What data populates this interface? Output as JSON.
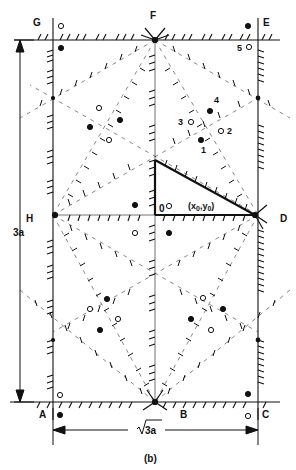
{
  "figure": {
    "caption": "(b)",
    "dimension_vertical": "3a",
    "dimension_horizontal": "√3a",
    "dimension_horizontal_radicand": "3a"
  },
  "vertices": {
    "G": "G",
    "F": "F",
    "E": "E",
    "H": "H",
    "D": "D",
    "A": "A",
    "B": "B",
    "C": "C",
    "O": "0"
  },
  "numbered_points": [
    "1",
    "2",
    "3",
    "4",
    "5"
  ],
  "point_label": "(x₀,y₀)",
  "point_label_parts": {
    "open": "(x",
    "sub0": "0",
    "mid": ",y",
    "sub1": "0",
    "close": ")"
  },
  "colors": {
    "ink": "#111111",
    "background": "#ffffff"
  }
}
